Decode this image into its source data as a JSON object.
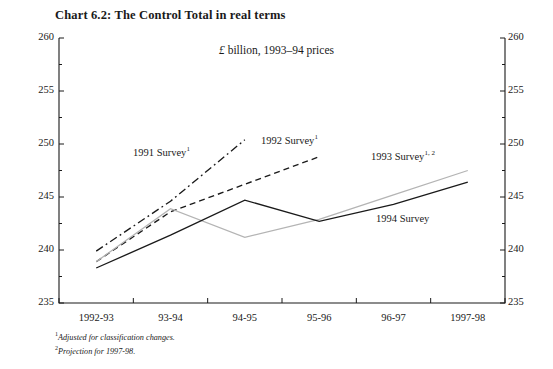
{
  "chart_data": {
    "type": "line",
    "title": "Chart 6.2: The Control Total in real terms",
    "subtitle_currency": "£",
    "subtitle_rest": " billion, 1993–94 prices",
    "xlabel": "",
    "ylabel": "",
    "categories": [
      "1992-93",
      "93-94",
      "94-95",
      "95-96",
      "96-97",
      "1997-98"
    ],
    "ylim": [
      235,
      260
    ],
    "ytick_labels": [
      "235",
      "240",
      "245",
      "250",
      "255",
      "260"
    ],
    "ytick_values": [
      235,
      240,
      245,
      250,
      255,
      260
    ],
    "yminor_values": [
      237.5,
      242.5,
      247.5,
      252.5,
      257.5
    ],
    "grid": false,
    "legend": "inline-annotations",
    "dual_axis": true,
    "series": [
      {
        "name": "1991 Survey",
        "footnote_marks": "1",
        "style": "dash-dot",
        "color": "#1a1a1a",
        "x": [
          "1992-93",
          "93-94",
          "94-95"
        ],
        "values": [
          239.9,
          244.6,
          250.4
        ]
      },
      {
        "name": "1992 Survey",
        "footnote_marks": "1",
        "style": "dashed",
        "color": "#1a1a1a",
        "x": [
          "1992-93",
          "93-94",
          "95-96"
        ],
        "values": [
          238.9,
          243.6,
          248.8
        ]
      },
      {
        "name": "1993 Survey",
        "footnote_marks": "1, 2",
        "style": "solid-light",
        "color": "#b4b4b4",
        "x": [
          "1992-93",
          "93-94",
          "94-95",
          "95-96",
          "96-97",
          "1997-98"
        ],
        "values": [
          238.9,
          243.9,
          241.2,
          242.9,
          245.2,
          247.5
        ]
      },
      {
        "name": "1994 Survey",
        "footnote_marks": "",
        "style": "solid",
        "color": "#1a1a1a",
        "x": [
          "1992-93",
          "93-94",
          "94-95",
          "95-96",
          "96-97",
          "1997-98"
        ],
        "values": [
          238.3,
          241.4,
          244.7,
          242.7,
          244.3,
          246.4
        ]
      }
    ],
    "annotations": [
      {
        "text": "1991 Survey",
        "sup": "1",
        "x_px": 133,
        "y_px": 145
      },
      {
        "text": "1992 Survey",
        "sup": "1",
        "x_px": 261,
        "y_px": 133
      },
      {
        "text": "1993 Survey",
        "sup": "1, 2",
        "x_px": 371,
        "y_px": 149
      },
      {
        "text": "1994 Survey",
        "sup": "",
        "x_px": 376,
        "y_px": 213
      }
    ],
    "footnotes": [
      {
        "mark": "1",
        "text": "Adjusted for classification changes."
      },
      {
        "mark": "2",
        "text": "Projection for 1997-98."
      }
    ]
  }
}
